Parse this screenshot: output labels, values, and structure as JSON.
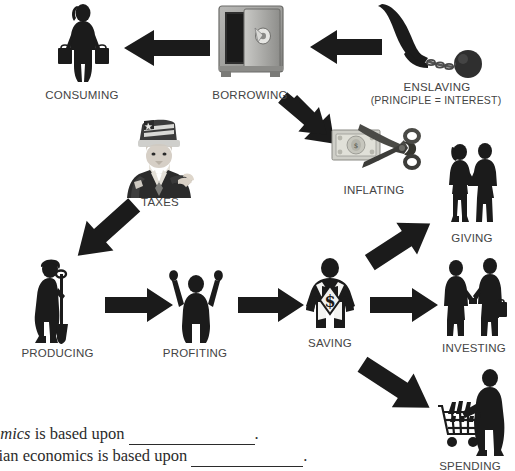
{
  "diagram": {
    "title_present": false,
    "background": "#ffffff",
    "ink": "#2b2b2b",
    "label_color": "#444444",
    "nodes": [
      {
        "id": "consuming",
        "label": "CONSUMING",
        "icon": "woman-shopping-bags-icon",
        "x": 82,
        "y": 45,
        "label_x": 82,
        "label_y": 97
      },
      {
        "id": "borrowing",
        "label": "BORROWING",
        "icon": "safe-vault-icon",
        "x": 250,
        "y": 44,
        "label_x": 250,
        "label_y": 97
      },
      {
        "id": "enslaving",
        "label": "ENSLAVING",
        "sublabel": "(PRINCIPLE = INTEREST)",
        "icon": "ball-and-chain-icon",
        "x": 437,
        "y": 42,
        "label_x": 437,
        "label_y": 88,
        "sublabel_x": 437,
        "sublabel_y": 101
      },
      {
        "id": "taxes",
        "label": "TAXES",
        "icon": "uncle-sam-icon",
        "x": 159,
        "y": 163,
        "label_x": 159,
        "label_y": 203
      },
      {
        "id": "inflating",
        "label": "INFLATING",
        "icon": "scissors-cutting-dollar-icon",
        "x": 374,
        "y": 152,
        "label_x": 374,
        "label_y": 191
      },
      {
        "id": "giving",
        "label": "GIVING",
        "icon": "couple-exchanging-gift-icon",
        "x": 472,
        "y": 195,
        "label_x": 472,
        "label_y": 240
      },
      {
        "id": "producing",
        "label": "PRODUCING",
        "icon": "worker-with-shovel-icon",
        "x": 60,
        "y": 300,
        "label_x": 57,
        "label_y": 355
      },
      {
        "id": "profiting",
        "label": "PROFITING",
        "icon": "man-arms-raised-icon",
        "x": 195,
        "y": 300,
        "label_x": 195,
        "label_y": 355
      },
      {
        "id": "saving",
        "label": "SAVING",
        "icon": "superhero-dollar-chest-icon",
        "x": 329,
        "y": 298,
        "label_x": 329,
        "label_y": 345
      },
      {
        "id": "investing",
        "label": "INVESTING",
        "icon": "two-men-handshake-icon",
        "x": 472,
        "y": 300,
        "label_x": 472,
        "label_y": 350
      },
      {
        "id": "spending",
        "label": "SPENDING",
        "icon": "man-shopping-cart-icon",
        "x": 470,
        "y": 410,
        "label_x": 470,
        "label_y": 468
      }
    ],
    "arrows": [
      {
        "id": "borrowing-to-consuming",
        "from": "borrowing",
        "to": "consuming",
        "direction": "left"
      },
      {
        "id": "enslaving-to-borrowing",
        "from": "enslaving",
        "to": "borrowing",
        "direction": "left"
      },
      {
        "id": "inflating-to-borrowing",
        "from": "inflating",
        "to": "borrowing",
        "direction": "up-left"
      },
      {
        "id": "producing-to-taxes",
        "from": "producing",
        "to": "taxes",
        "direction": "up-right"
      },
      {
        "id": "saving-to-borrowing",
        "from": "saving",
        "to": "borrowing",
        "direction": "up-left"
      },
      {
        "id": "producing-to-profiting",
        "from": "producing",
        "to": "profiting",
        "direction": "right"
      },
      {
        "id": "profiting-to-saving",
        "from": "profiting",
        "to": "saving",
        "direction": "right"
      },
      {
        "id": "saving-to-giving",
        "from": "saving",
        "to": "giving",
        "direction": "up-right"
      },
      {
        "id": "saving-to-investing",
        "from": "saving",
        "to": "investing",
        "direction": "right"
      },
      {
        "id": "saving-to-spending",
        "from": "saving",
        "to": "spending",
        "direction": "down-right"
      }
    ]
  },
  "questions": [
    {
      "id": "question-1",
      "prefix_italic": "omics",
      "text": " is based upon ",
      "blank_width_px": 126,
      "suffix": "."
    },
    {
      "id": "question-2",
      "prefix_italic": "",
      "text": "sian economics is based upon ",
      "blank_width_px": 112,
      "suffix": "."
    }
  ]
}
